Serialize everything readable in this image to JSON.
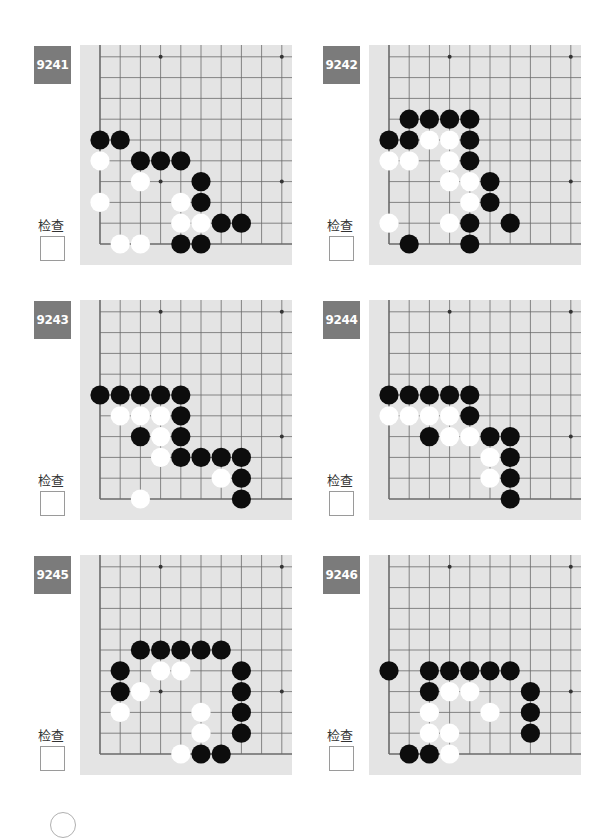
{
  "check_label": "检查",
  "colors": {
    "badge": "#7b7b7b",
    "board": "#e4e4e4",
    "grid": "#6a6a6a",
    "black_stone": "#0d0d0d",
    "white_stone": "#ffffff"
  },
  "problems": [
    {
      "id": "9241",
      "black": [
        [
          0,
          5
        ],
        [
          1,
          5
        ],
        [
          2,
          4
        ],
        [
          3,
          4
        ],
        [
          4,
          4
        ],
        [
          5,
          3
        ],
        [
          5,
          2
        ],
        [
          6,
          1
        ],
        [
          7,
          1
        ],
        [
          4,
          0
        ],
        [
          5,
          0
        ]
      ],
      "white": [
        [
          0,
          4
        ],
        [
          2,
          3
        ],
        [
          0,
          2
        ],
        [
          4,
          2
        ],
        [
          4,
          1
        ],
        [
          5,
          1
        ],
        [
          1,
          0
        ],
        [
          2,
          0
        ]
      ]
    },
    {
      "id": "9242",
      "black": [
        [
          1,
          6
        ],
        [
          2,
          6
        ],
        [
          3,
          6
        ],
        [
          4,
          6
        ],
        [
          0,
          5
        ],
        [
          1,
          5
        ],
        [
          4,
          5
        ],
        [
          4,
          4
        ],
        [
          5,
          3
        ],
        [
          5,
          2
        ],
        [
          4,
          1
        ],
        [
          6,
          1
        ],
        [
          1,
          0
        ],
        [
          4,
          0
        ]
      ],
      "white": [
        [
          2,
          5
        ],
        [
          3,
          5
        ],
        [
          0,
          4
        ],
        [
          1,
          4
        ],
        [
          3,
          4
        ],
        [
          3,
          3
        ],
        [
          4,
          3
        ],
        [
          4,
          2
        ],
        [
          0,
          1
        ],
        [
          3,
          1
        ]
      ]
    },
    {
      "id": "9243",
      "black": [
        [
          0,
          5
        ],
        [
          1,
          5
        ],
        [
          2,
          5
        ],
        [
          3,
          5
        ],
        [
          4,
          5
        ],
        [
          4,
          4
        ],
        [
          2,
          3
        ],
        [
          4,
          3
        ],
        [
          4,
          2
        ],
        [
          5,
          2
        ],
        [
          6,
          2
        ],
        [
          7,
          2
        ],
        [
          7,
          1
        ],
        [
          7,
          0
        ]
      ],
      "white": [
        [
          1,
          4
        ],
        [
          2,
          4
        ],
        [
          3,
          4
        ],
        [
          3,
          3
        ],
        [
          3,
          2
        ],
        [
          6,
          1
        ],
        [
          2,
          0
        ]
      ]
    },
    {
      "id": "9244",
      "black": [
        [
          0,
          5
        ],
        [
          1,
          5
        ],
        [
          2,
          5
        ],
        [
          3,
          5
        ],
        [
          4,
          5
        ],
        [
          4,
          4
        ],
        [
          2,
          3
        ],
        [
          5,
          3
        ],
        [
          6,
          3
        ],
        [
          6,
          2
        ],
        [
          6,
          1
        ],
        [
          6,
          0
        ]
      ],
      "white": [
        [
          0,
          4
        ],
        [
          1,
          4
        ],
        [
          2,
          4
        ],
        [
          3,
          4
        ],
        [
          3,
          3
        ],
        [
          4,
          3
        ],
        [
          5,
          2
        ],
        [
          5,
          1
        ]
      ]
    },
    {
      "id": "9245",
      "black": [
        [
          2,
          5
        ],
        [
          3,
          5
        ],
        [
          4,
          5
        ],
        [
          5,
          5
        ],
        [
          6,
          5
        ],
        [
          1,
          4
        ],
        [
          7,
          4
        ],
        [
          1,
          3
        ],
        [
          7,
          3
        ],
        [
          7,
          2
        ],
        [
          7,
          1
        ],
        [
          5,
          0
        ],
        [
          6,
          0
        ]
      ],
      "white": [
        [
          3,
          4
        ],
        [
          4,
          4
        ],
        [
          2,
          3
        ],
        [
          1,
          2
        ],
        [
          5,
          2
        ],
        [
          5,
          1
        ],
        [
          4,
          0
        ]
      ]
    },
    {
      "id": "9246",
      "black": [
        [
          0,
          4
        ],
        [
          2,
          4
        ],
        [
          3,
          4
        ],
        [
          4,
          4
        ],
        [
          5,
          4
        ],
        [
          6,
          4
        ],
        [
          2,
          3
        ],
        [
          7,
          3
        ],
        [
          7,
          2
        ],
        [
          7,
          1
        ],
        [
          1,
          0
        ],
        [
          2,
          0
        ]
      ],
      "white": [
        [
          3,
          3
        ],
        [
          4,
          3
        ],
        [
          2,
          2
        ],
        [
          5,
          2
        ],
        [
          2,
          1
        ],
        [
          3,
          1
        ],
        [
          3,
          0
        ]
      ]
    }
  ]
}
